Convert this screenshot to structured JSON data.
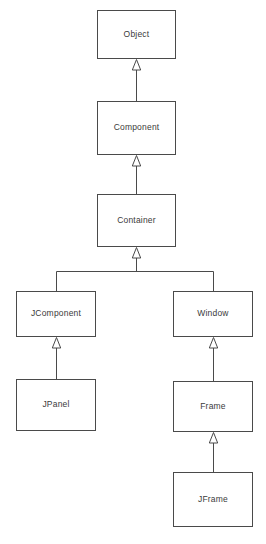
{
  "diagram": {
    "type": "uml-class-hierarchy",
    "background_color": "#ffffff",
    "box_fill_color": "#ffffff",
    "box_border_color": "#4a4a4a",
    "line_color": "#4a4a4a",
    "text_color": "#3a3a3a",
    "arrow_style": "hollow-triangle-generalization",
    "nodes": [
      {
        "id": "object",
        "label": "Object",
        "x": 97,
        "y": 10,
        "w": 79,
        "h": 49
      },
      {
        "id": "component",
        "label": "Component",
        "x": 97,
        "y": 101,
        "w": 79,
        "h": 54
      },
      {
        "id": "container",
        "label": "Container",
        "x": 97,
        "y": 194,
        "w": 79,
        "h": 53
      },
      {
        "id": "jcomponent",
        "label": "JComponent",
        "x": 16,
        "y": 291,
        "w": 80,
        "h": 46
      },
      {
        "id": "window",
        "label": "Window",
        "x": 173,
        "y": 291,
        "w": 80,
        "h": 46
      },
      {
        "id": "jpanel",
        "label": "JPanel",
        "x": 16,
        "y": 379,
        "w": 80,
        "h": 52
      },
      {
        "id": "frame",
        "label": "Frame",
        "x": 173,
        "y": 381,
        "w": 80,
        "h": 51
      },
      {
        "id": "jframe",
        "label": "JFrame",
        "x": 173,
        "y": 472,
        "w": 80,
        "h": 55
      }
    ],
    "edges": [
      {
        "from": "component",
        "to": "object",
        "relation": "extends"
      },
      {
        "from": "container",
        "to": "component",
        "relation": "extends"
      },
      {
        "from": "jcomponent",
        "to": "container",
        "relation": "extends"
      },
      {
        "from": "window",
        "to": "container",
        "relation": "extends"
      },
      {
        "from": "jpanel",
        "to": "jcomponent",
        "relation": "extends"
      },
      {
        "from": "frame",
        "to": "window",
        "relation": "extends"
      },
      {
        "from": "jframe",
        "to": "frame",
        "relation": "extends"
      }
    ]
  }
}
